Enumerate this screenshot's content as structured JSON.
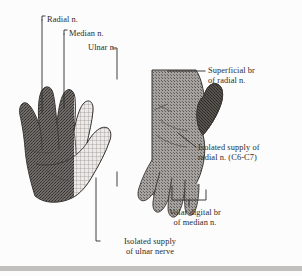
{
  "figure": {
    "background_color": "#fcfcfc",
    "ink_color": "#2b2b2b",
    "bottom_bar_color": "#c0c0c0"
  },
  "labels": {
    "radial": "Radial n.",
    "median": "Median n.",
    "ulnar": "Ulnar n.",
    "superficial_branch_line1": "Superficial br",
    "superficial_branch_line2": "of radial n.",
    "isolated_radial_line1": "Isolated supply of",
    "isolated_radial_line2": "radial n. (C6-C7)",
    "volar_digital_line1": "Volar digital br",
    "volar_digital_line2": "of median n.",
    "isolated_ulnar_line1": "Isolated supply",
    "isolated_ulnar_line2": "of ulnar nerve"
  },
  "hands": {
    "left": {
      "name": "left-hand-dorsal-view",
      "view": "dorsal",
      "territories": [
        {
          "nerve": "radial",
          "pattern": "dark-stipple",
          "color": "#6d6a67"
        },
        {
          "nerve": "ulnar",
          "pattern": "fine-grid-hatch",
          "color": "#b9b7b4"
        }
      ]
    },
    "right": {
      "name": "right-hand-palmar-view",
      "view": "palmar",
      "territories": [
        {
          "nerve": "median",
          "pattern": "medium-stipple",
          "color": "#8c8a87"
        },
        {
          "nerve": "radial",
          "pattern": "dark-stipple",
          "color": "#5f5c59"
        }
      ]
    }
  }
}
